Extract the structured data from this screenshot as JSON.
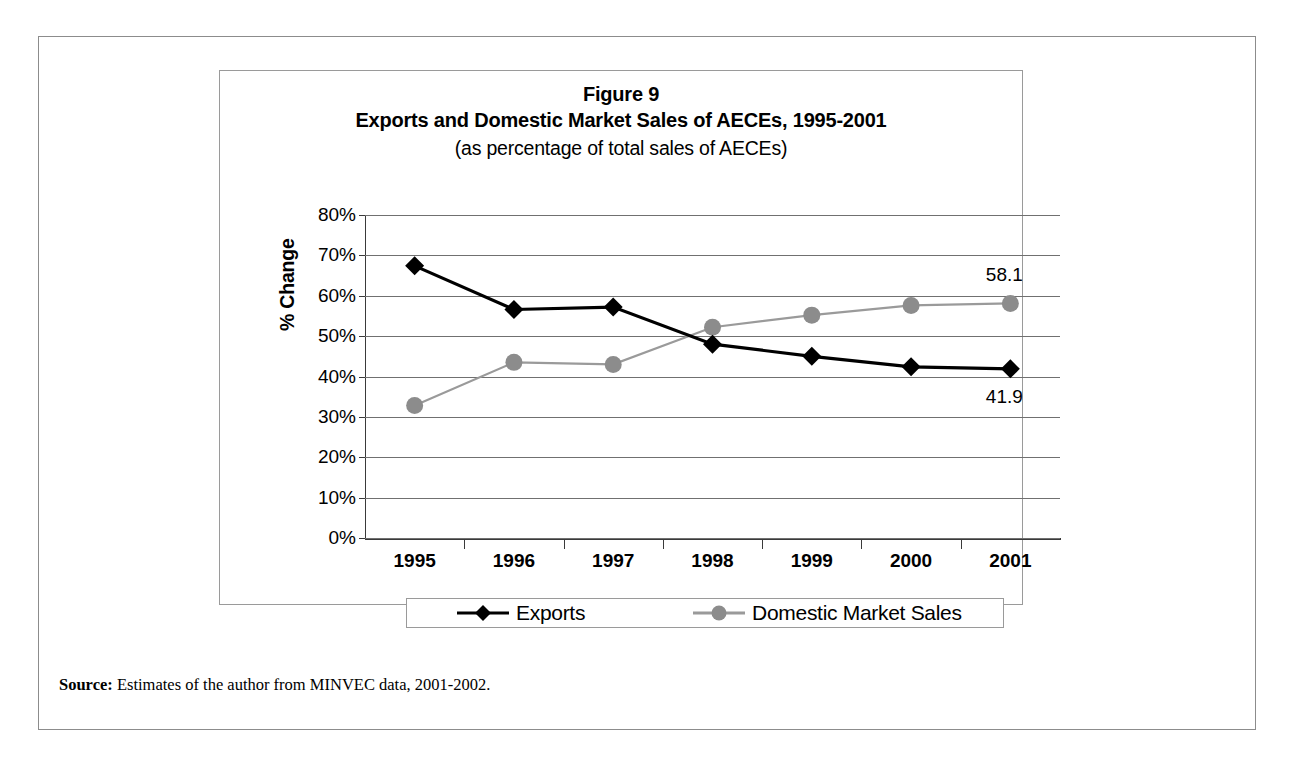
{
  "figure": {
    "title_line1": "Figure 9",
    "title_line2": "Exports and Domestic Market Sales of AECEs, 1995-2001",
    "title_line3": "(as percentage of total sales of AECEs)",
    "source_label": "Source:",
    "source_text": " Estimates of the author from MINVEC data, 2001-2002."
  },
  "chart_data": {
    "type": "line",
    "title": "Exports and Domestic Market Sales of AECEs, 1995-2001",
    "subtitle": "(as percentage of total sales of AECEs)",
    "xlabel": "",
    "ylabel": "% Change",
    "categories": [
      "1995",
      "1996",
      "1997",
      "1998",
      "1999",
      "2000",
      "2001"
    ],
    "ylim": [
      0,
      80
    ],
    "ytick_values": [
      0,
      10,
      20,
      30,
      40,
      50,
      60,
      70,
      80
    ],
    "ytick_labels": [
      "0%",
      "10%",
      "20%",
      "30%",
      "40%",
      "50%",
      "60%",
      "70%",
      "80%"
    ],
    "grid": true,
    "legend_position": "bottom",
    "series": [
      {
        "name": "Exports",
        "marker": "diamond",
        "color": "#000000",
        "values": [
          67.4,
          56.6,
          57.2,
          48.0,
          45.0,
          42.4,
          41.9
        ]
      },
      {
        "name": "Domestic Market Sales",
        "marker": "circle",
        "color": "#8c8c8c",
        "values": [
          32.8,
          43.5,
          43.0,
          52.2,
          55.2,
          57.6,
          58.1
        ]
      }
    ],
    "annotations": [
      {
        "text": "58.1",
        "series": "Domestic Market Sales",
        "category": "2001",
        "value": 58.1
      },
      {
        "text": "41.9",
        "series": "Exports",
        "category": "2001",
        "value": 41.9
      }
    ]
  }
}
